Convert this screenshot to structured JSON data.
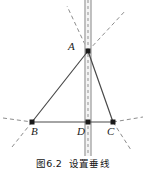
{
  "figure": {
    "caption_number": "图6.2",
    "caption_text": "设置垂线",
    "width": 146,
    "height": 174,
    "background_color": "#ffffff"
  },
  "points": [
    {
      "id": "A",
      "label": "A",
      "x": 88,
      "y": 51,
      "label_x": 68,
      "label_y": 41
    },
    {
      "id": "B",
      "label": "B",
      "x": 32,
      "y": 122,
      "label_x": 31,
      "label_y": 126
    },
    {
      "id": "D",
      "label": "D",
      "x": 88,
      "y": 122,
      "label_x": 77,
      "label_y": 126
    },
    {
      "id": "C",
      "label": "C",
      "x": 113,
      "y": 122,
      "label_x": 107,
      "label_y": 126
    }
  ],
  "solid_segments": [
    {
      "name": "side-AB",
      "x1": 88,
      "y1": 51,
      "x2": 32,
      "y2": 122
    },
    {
      "name": "side-AC",
      "x1": 88,
      "y1": 51,
      "x2": 113,
      "y2": 122
    },
    {
      "name": "base-BC",
      "x1": 32,
      "y1": 122,
      "x2": 113,
      "y2": 122
    }
  ],
  "dashed_segments": [
    {
      "name": "construction-upleft-from-A",
      "x1": 88,
      "y1": 51,
      "x2": 67,
      "y2": 6
    },
    {
      "name": "construction-upright-from-A",
      "x1": 88,
      "y1": 51,
      "x2": 126,
      "y2": 10
    },
    {
      "name": "extension-AB-below-B",
      "x1": 32,
      "y1": 122,
      "x2": 12,
      "y2": 147
    },
    {
      "name": "extension-AC-below-C",
      "x1": 113,
      "y1": 122,
      "x2": 131,
      "y2": 150
    },
    {
      "name": "baseline-extension-left",
      "x1": 32,
      "y1": 122,
      "x2": 3,
      "y2": 118
    },
    {
      "name": "baseline-extension-right",
      "x1": 113,
      "y1": 122,
      "x2": 143,
      "y2": 117
    }
  ],
  "guide_band": {
    "name": "perpendicular-guide-line",
    "center_x": 88,
    "top_y": 0,
    "bottom_y": 156,
    "width": 7,
    "edge_color": "#9a9a9a",
    "fill_color": "#f2f2f2",
    "dash_color": "#b0b0b0"
  },
  "styles": {
    "line_color": "#4a4a4a",
    "dash_color": "#8c8c8c",
    "point_color": "#1a1a1a",
    "label_color": "#1a1a1a"
  }
}
